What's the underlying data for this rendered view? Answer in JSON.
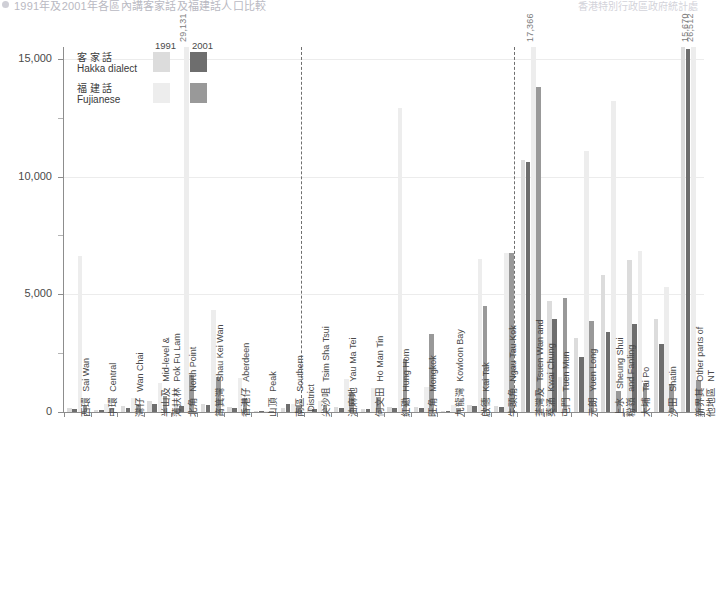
{
  "header": {
    "bullet_icon": "bullet-icon",
    "text": "1991年及2001年各區內講客家話及福建話人口比較",
    "right_text": "香港特別行政區政府統計處"
  },
  "legend": {
    "years": [
      "1991",
      "2001"
    ],
    "rows": [
      {
        "zh": "客家話",
        "en": "Hakka dialect",
        "c1991": "#dcdcdc",
        "c2001": "#6e6e6e"
      },
      {
        "zh": "福建話",
        "en": "Fujianese",
        "c1991": "#ededed",
        "c2001": "#999999"
      }
    ]
  },
  "axis": {
    "y_ticks": [
      "15,000",
      "10,000",
      "5,000",
      "0"
    ],
    "y_values": [
      15000,
      10000,
      5000,
      0
    ],
    "y_minor": [
      12500,
      7500,
      2500
    ],
    "ymax": 15500
  },
  "annotations": [
    {
      "text": "29,131",
      "cat": 4,
      "series": "fuj1991"
    },
    {
      "text": "17,366",
      "cat": 17,
      "series": "fuj1991"
    },
    {
      "text": "15,670",
      "cat": 23,
      "series": "hak2001"
    },
    {
      "text": "26,512",
      "cat": 23,
      "series": "fuj1991"
    }
  ],
  "chart_data": {
    "type": "bar",
    "title": "1991年及2001年各區內講客家話及福建話人口比較",
    "xlabel": "",
    "ylabel": "",
    "ylim": [
      0,
      15500
    ],
    "grid": true,
    "legend_position": "top-left",
    "categories": [
      {
        "zh": "西環",
        "en": "Sai Wan"
      },
      {
        "zh": "中環",
        "en": "Central"
      },
      {
        "zh": "灣仔",
        "en": "Wan Chai"
      },
      {
        "zh": "半山及薄扶林",
        "en": "Mid-level & Pok Fu Lam"
      },
      {
        "zh": "北角",
        "en": "North Point"
      },
      {
        "zh": "筲箕灣",
        "en": "Shau Kei Wan"
      },
      {
        "zh": "香港仔",
        "en": "Aberdeen"
      },
      {
        "zh": "山頂",
        "en": "Peak"
      },
      {
        "zh": "南區",
        "en": "Southern District"
      },
      {
        "zh": "尖沙咀",
        "en": "Tsim Sha Tsui"
      },
      {
        "zh": "油麻地",
        "en": "Yau Ma Tei"
      },
      {
        "zh": "何文田",
        "en": "Ho Man Tin"
      },
      {
        "zh": "紅磡",
        "en": "Hung Hom"
      },
      {
        "zh": "旺角",
        "en": "Mongkok"
      },
      {
        "zh": "九龍灣",
        "en": "Kowloon Bay"
      },
      {
        "zh": "啟德",
        "en": "Kai Tak"
      },
      {
        "zh": "牛頭角",
        "en": "Ngau Tau Kok"
      },
      {
        "zh": "荃灣及葵涌",
        "en": "Tsuen Wan and Kwai Chung"
      },
      {
        "zh": "屯門",
        "en": "Tuen Mun"
      },
      {
        "zh": "元朗",
        "en": "Yuen Long"
      },
      {
        "zh": "上水 粉嶺",
        "en": "Sheung Shui and Fanling"
      },
      {
        "zh": "大埔",
        "en": "Tai Po"
      },
      {
        "zh": "沙田",
        "en": "Shatin"
      },
      {
        "zh": "新界其他地區",
        "en": "Other parts of NT"
      }
    ],
    "series": [
      {
        "name": "客家話 Hakka dialect 1991",
        "key": "hak1991",
        "color": "#dcdcdc",
        "values": [
          170,
          90,
          240,
          450,
          300,
          330,
          220,
          40,
          150,
          160,
          230,
          130,
          200,
          210,
          60,
          300,
          240,
          10700,
          4700,
          3150,
          5800,
          6450,
          3950,
          15670
        ]
      },
      {
        "name": "客家話 Hakka dialect 2001",
        "key": "hak2001",
        "color": "#6e6e6e",
        "values": [
          120,
          70,
          180,
          360,
          250,
          280,
          170,
          30,
          330,
          130,
          180,
          110,
          170,
          170,
          50,
          250,
          200,
          10600,
          3950,
          2350,
          3400,
          3750,
          2900,
          15400
        ]
      },
      {
        "name": "福建話 Fujianese 1991",
        "key": "fuj1991",
        "color": "#ededed",
        "values": [
          6620,
          320,
          600,
          1250,
          29131,
          4350,
          1450,
          60,
          330,
          480,
          1400,
          1000,
          12900,
          1050,
          280,
          6480,
          6750,
          17366,
          1500,
          11100,
          13200,
          6850,
          5300,
          26512
        ]
      },
      {
        "name": "福建話 Fujianese 2001",
        "key": "fuj2001",
        "color": "#999999",
        "values": [
          250,
          180,
          330,
          700,
          1570,
          1470,
          600,
          40,
          240,
          280,
          800,
          620,
          2250,
          3300,
          160,
          4500,
          6750,
          13800,
          4850,
          3850,
          900,
          1250,
          1200,
          1350
        ]
      }
    ]
  }
}
